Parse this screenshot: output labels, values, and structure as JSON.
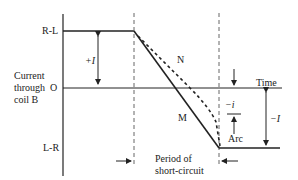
{
  "diagram": {
    "y_labels": {
      "top": "R-L",
      "origin": "O",
      "bottom": "L-R"
    },
    "axis_title": [
      "Current",
      "through",
      "coil B"
    ],
    "time_label": "Time",
    "curve_labels": {
      "solid": "M",
      "dashed": "N"
    },
    "plus_I": "+I",
    "minus_I": "−I",
    "minus_i": "−i",
    "arc": "Arc",
    "period": [
      "Period of",
      "short-circuit"
    ]
  },
  "colors": {
    "line": "#222222",
    "background": "#ffffff"
  }
}
